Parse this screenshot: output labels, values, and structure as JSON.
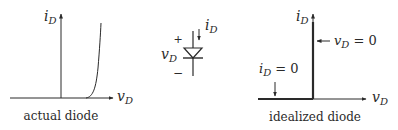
{
  "diagram": {
    "colors": {
      "line": "#2a2a2a",
      "background": "#ffffff"
    },
    "actual_diode": {
      "caption": "actual diode",
      "y_axis_label": {
        "main": "i",
        "sub": "D"
      },
      "x_axis_label": {
        "main": "v",
        "sub": "D"
      },
      "curve": "exponential rise to the right of origin"
    },
    "diode_symbol": {
      "current_label": {
        "main": "i",
        "sub": "D"
      },
      "voltage_label": {
        "main": "v",
        "sub": "D"
      },
      "plus": "+",
      "minus": "−"
    },
    "idealized_diode": {
      "caption": "idealized diode",
      "y_axis_label": {
        "main": "i",
        "sub": "D"
      },
      "x_axis_label": {
        "main": "v",
        "sub": "D"
      },
      "vertical_annotation": {
        "main": "v",
        "sub": "D",
        "rest": " = 0"
      },
      "horizontal_annotation": {
        "main": "i",
        "sub": "D",
        "rest": " = 0"
      }
    }
  }
}
